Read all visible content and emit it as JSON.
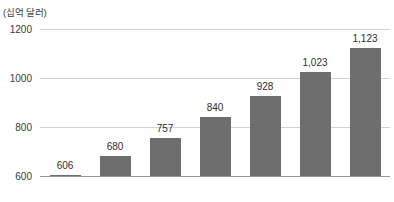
{
  "chart_data": {
    "type": "bar",
    "title": "",
    "subtitle": "",
    "unit_label": "(십억 달러)",
    "xlabel": "",
    "ylabel": "",
    "categories": [
      "2019",
      "2020",
      "2021",
      "2022",
      "2023",
      "2024",
      "2025"
    ],
    "values": [
      606,
      680,
      757,
      840,
      928,
      1023,
      1123
    ],
    "value_labels": [
      "606",
      "680",
      "757",
      "840",
      "928",
      "1,023",
      "1,123"
    ],
    "ylim": [
      600,
      1200
    ],
    "yticks": [
      600,
      800,
      1000,
      1200
    ],
    "ytick_labels": [
      "600",
      "800",
      "1000",
      "1200"
    ],
    "grid": true,
    "legend": null,
    "series": [
      {
        "name": "",
        "values": [
          606,
          680,
          757,
          840,
          928,
          1023,
          1123
        ]
      }
    ],
    "colors": {
      "bar": "#6e6e6e",
      "gridline": "#d2d2d2",
      "baseline": "#9a9a9a",
      "text": "#2e2e2e",
      "background": "#ffffff"
    }
  }
}
